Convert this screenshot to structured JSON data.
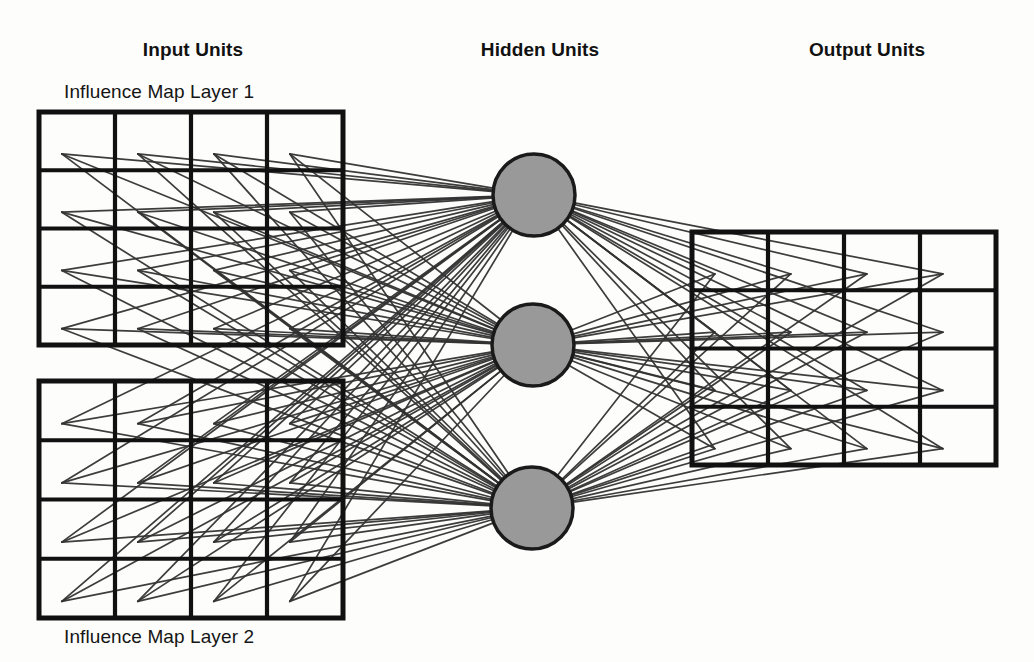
{
  "figure": {
    "type": "neural-network-architecture-diagram",
    "background_color": "#fdfdfc",
    "line_color": "#333333",
    "grid_stroke_color": "#111111",
    "node_fill_color": "#999999",
    "node_stroke_color": "#1a1a1a"
  },
  "headers": {
    "input": "Input Units",
    "hidden": "Hidden Units",
    "output": "Output Units"
  },
  "captions": {
    "layer1": "Influence Map Layer 1",
    "layer2": "Influence Map Layer 2"
  },
  "chart_data": {
    "type": "diagram",
    "layers": [
      {
        "name": "Input Units",
        "kind": "grid-group",
        "grids": [
          {
            "label": "Influence Map Layer 1",
            "rows": 4,
            "cols": 4,
            "cells": 16,
            "x": 39,
            "y": 112,
            "width": 304,
            "height": 233,
            "label_position": "above"
          },
          {
            "label": "Influence Map Layer 2",
            "rows": 4,
            "cols": 4,
            "cells": 16,
            "x": 39,
            "y": 381,
            "width": 304,
            "height": 237,
            "label_position": "below"
          }
        ],
        "total_units": 32
      },
      {
        "name": "Hidden Units",
        "kind": "circles",
        "count": 3,
        "radius": 41,
        "centers": [
          {
            "cx": 534,
            "cy": 195
          },
          {
            "cx": 533,
            "cy": 345
          },
          {
            "cx": 532,
            "cy": 508
          }
        ]
      },
      {
        "name": "Output Units",
        "kind": "grid-group",
        "grids": [
          {
            "label": "",
            "rows": 4,
            "cols": 4,
            "cells": 16,
            "x": 692,
            "y": 232,
            "width": 304,
            "height": 233,
            "label_position": "none"
          }
        ],
        "total_units": 16
      }
    ],
    "connections": [
      {
        "from": "Input Units",
        "to": "Hidden Units",
        "pattern": "fully-connected",
        "count": 96
      },
      {
        "from": "Hidden Units",
        "to": "Output Units",
        "pattern": "fully-connected",
        "count": 48
      }
    ],
    "header_positions": [
      {
        "text": "Input Units",
        "x": 193,
        "y": 50
      },
      {
        "text": "Hidden Units",
        "x": 540,
        "y": 50
      },
      {
        "text": "Output Units",
        "x": 867,
        "y": 50
      }
    ]
  }
}
